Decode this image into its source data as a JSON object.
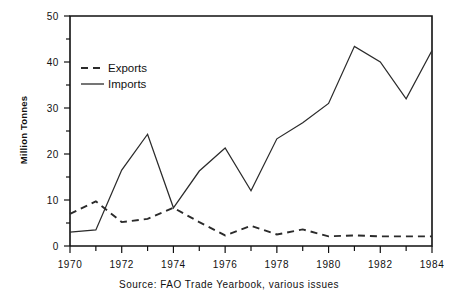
{
  "chart_data": {
    "type": "line",
    "title": "",
    "subtitle": "",
    "xlabel": "",
    "ylabel": "Million Tonnes",
    "xlim": [
      1970,
      1984
    ],
    "ylim": [
      0,
      50
    ],
    "grid": false,
    "legend_position": "upper-left-inside",
    "x": [
      1970,
      1971,
      1972,
      1973,
      1974,
      1975,
      1976,
      1977,
      1978,
      1979,
      1980,
      1981,
      1982,
      1983,
      1984
    ],
    "xtick_labels": [
      "1970",
      "1972",
      "1974",
      "1976",
      "1978",
      "1980",
      "1982",
      "1984"
    ],
    "xtick_values": [
      1970,
      1972,
      1974,
      1976,
      1978,
      1980,
      1982,
      1984
    ],
    "xminor_tick_values": [
      1971,
      1973,
      1975,
      1977,
      1979,
      1981,
      1983
    ],
    "ytick_labels": [
      "0",
      "10",
      "20",
      "30",
      "40",
      "50"
    ],
    "ytick_values": [
      0,
      10,
      20,
      30,
      40,
      50
    ],
    "yminor_tick_values": [
      5,
      15,
      25,
      35,
      45
    ],
    "series": [
      {
        "name": "Exports",
        "style": "dashed",
        "color": "#2b2b2b",
        "values": [
          7.0,
          9.7,
          5.2,
          5.9,
          8.3,
          5.2,
          2.3,
          4.4,
          2.5,
          3.6,
          2.1,
          2.3,
          2.1,
          2.1,
          2.1
        ]
      },
      {
        "name": "Imports",
        "style": "solid",
        "color": "#2b2b2b",
        "values": [
          3.0,
          3.5,
          16.5,
          24.3,
          8.3,
          16.3,
          21.3,
          12.0,
          23.3,
          26.8,
          31.0,
          43.4,
          40.0,
          32.0,
          42.5
        ]
      }
    ],
    "annotations": [],
    "caption": "Source: FAO Trade Yearbook, various issues"
  },
  "legend": {
    "items": [
      {
        "label": "Exports",
        "style": "dashed"
      },
      {
        "label": "Imports",
        "style": "solid"
      }
    ]
  },
  "axes": {
    "y_title": "Million Tonnes"
  },
  "footer": {
    "source_text": "Source: FAO Trade Yearbook, various issues"
  }
}
